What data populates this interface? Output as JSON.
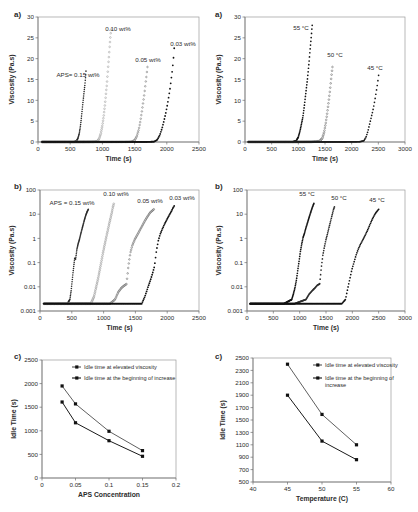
{
  "figure": {
    "panels": [
      "a-left",
      "a-right",
      "b-left",
      "b-right",
      "c-left",
      "c-right"
    ],
    "labels": {
      "a": "a)",
      "b": "b)",
      "c": "c)"
    }
  },
  "chart_data": [
    {
      "id": "a-left",
      "type": "scatter",
      "panel_label": "a)",
      "title": "",
      "xlabel": "Time (s)",
      "ylabel": "Viscosity (Pa.s)",
      "xlim": [
        0,
        2500
      ],
      "ylim": [
        0,
        30
      ],
      "xticks": [
        0,
        500,
        1000,
        1500,
        2000,
        2500
      ],
      "yticks": [
        0,
        5,
        10,
        15,
        20,
        25,
        30
      ],
      "yscale": "linear",
      "grid": false,
      "legend_position": "inline-annotations",
      "annotations": [
        "APS= 0.15 wt%",
        "0.10 wt%",
        "0.05 wt%",
        "0.03 wt%"
      ],
      "series": [
        {
          "name": "APS= 0.15 wt%",
          "onset_s": 590,
          "end_s": 745,
          "end_visc": 17.0,
          "x": [
            60,
            200,
            350,
            450,
            520,
            570,
            600,
            620,
            640,
            655,
            668,
            680,
            690,
            700,
            710,
            718,
            726,
            733,
            740,
            745
          ],
          "y": [
            0.02,
            0.02,
            0.02,
            0.03,
            0.04,
            0.08,
            0.3,
            0.9,
            2.0,
            3.4,
            5.0,
            6.8,
            8.3,
            9.8,
            11.2,
            12.4,
            13.4,
            14.6,
            15.8,
            17.0
          ]
        },
        {
          "name": "0.10 wt%",
          "onset_s": 930,
          "end_s": 1135,
          "end_visc": 27.0,
          "x": [
            60,
            300,
            550,
            750,
            870,
            920,
            950,
            975,
            1000,
            1020,
            1040,
            1055,
            1070,
            1082,
            1094,
            1104,
            1113,
            1121,
            1128,
            1135
          ],
          "y": [
            0.02,
            0.02,
            0.02,
            0.03,
            0.05,
            0.15,
            0.8,
            2.0,
            4.0,
            6.2,
            9.0,
            11.5,
            14.0,
            16.5,
            19.0,
            21.0,
            23.0,
            24.6,
            25.9,
            27.0
          ]
        },
        {
          "name": "0.05 wt%",
          "onset_s": 1480,
          "end_s": 1700,
          "end_visc": 18.0,
          "x": [
            60,
            400,
            800,
            1150,
            1350,
            1450,
            1500,
            1535,
            1565,
            1590,
            1612,
            1632,
            1650,
            1664,
            1676,
            1686,
            1692,
            1696,
            1699,
            1700
          ],
          "y": [
            0.02,
            0.02,
            0.02,
            0.02,
            0.03,
            0.06,
            0.4,
            1.4,
            3.0,
            5.0,
            7.2,
            9.4,
            11.4,
            13.2,
            14.8,
            16.0,
            16.9,
            17.4,
            17.8,
            18.0
          ]
        },
        {
          "name": "0.03 wt%",
          "onset_s": 1830,
          "end_s": 2115,
          "end_visc": 22.5,
          "x": [
            60,
            500,
            1000,
            1400,
            1700,
            1800,
            1850,
            1890,
            1925,
            1955,
            1985,
            2010,
            2032,
            2052,
            2068,
            2082,
            2094,
            2103,
            2110,
            2115
          ],
          "y": [
            0.02,
            0.02,
            0.02,
            0.02,
            0.03,
            0.08,
            0.5,
            1.6,
            3.2,
            5.0,
            7.0,
            9.0,
            11.0,
            13.0,
            15.0,
            16.8,
            18.5,
            20.0,
            21.4,
            22.5
          ]
        }
      ]
    },
    {
      "id": "a-right",
      "type": "scatter",
      "panel_label": "a)",
      "title": "",
      "xlabel": "Time (s)",
      "ylabel": "Viscosity (Pa.s)",
      "xlim": [
        0,
        3000
      ],
      "ylim": [
        0,
        30
      ],
      "xticks": [
        0,
        500,
        1000,
        1500,
        2000,
        2500,
        3000
      ],
      "yticks": [
        0,
        5,
        10,
        15,
        20,
        25,
        30
      ],
      "yscale": "linear",
      "grid": false,
      "legend_position": "inline-annotations",
      "annotations": [
        "55 °C",
        "50 °C",
        "45 °C"
      ],
      "series": [
        {
          "name": "55 °C",
          "onset_s": 960,
          "end_s": 1260,
          "end_visc": 28.0,
          "x": [
            60,
            400,
            700,
            900,
            960,
            1000,
            1030,
            1060,
            1085,
            1110,
            1130,
            1150,
            1170,
            1188,
            1204,
            1218,
            1232,
            1244,
            1253,
            1260
          ],
          "y": [
            0.02,
            0.02,
            0.02,
            0.05,
            0.3,
            1.2,
            2.6,
            4.4,
            6.0,
            8.4,
            10.6,
            12.8,
            15.0,
            17.4,
            19.6,
            21.8,
            23.8,
            25.5,
            27.0,
            28.0
          ]
        },
        {
          "name": "50 °C",
          "onset_s": 1430,
          "end_s": 1640,
          "end_visc": 18.0,
          "x": [
            60,
            500,
            900,
            1250,
            1400,
            1450,
            1485,
            1515,
            1542,
            1566,
            1588,
            1606,
            1620,
            1630,
            1636,
            1640
          ],
          "y": [
            0.02,
            0.02,
            0.02,
            0.04,
            0.2,
            0.9,
            2.4,
            4.6,
            7.0,
            9.4,
            11.8,
            14.0,
            15.8,
            16.9,
            17.6,
            18.0
          ]
        },
        {
          "name": "45 °C",
          "onset_s": 2230,
          "end_s": 2505,
          "end_visc": 16.0,
          "x": [
            60,
            700,
            1300,
            1900,
            2150,
            2230,
            2270,
            2305,
            2335,
            2365,
            2395,
            2420,
            2445,
            2465,
            2482,
            2495,
            2505
          ],
          "y": [
            0.02,
            0.02,
            0.02,
            0.03,
            0.06,
            0.3,
            1.2,
            2.6,
            4.2,
            5.8,
            7.4,
            9.0,
            10.8,
            12.4,
            13.8,
            15.0,
            16.0
          ]
        }
      ]
    },
    {
      "id": "b-left",
      "type": "scatter",
      "panel_label": "b)",
      "title": "",
      "xlabel": "Time (s)",
      "ylabel": "Viscosity (Pa.s)",
      "xlim": [
        0,
        2500
      ],
      "ylim": [
        0.001,
        100
      ],
      "xticks": [
        0,
        500,
        1000,
        1500,
        2000,
        2500
      ],
      "yticks": [
        0.001,
        0.01,
        0.1,
        1,
        10,
        100
      ],
      "yscale": "log",
      "grid": false,
      "legend_position": "inline-annotations",
      "annotations": [
        "APS = 0.15 wt%",
        "0.10 wt%",
        "0.05 wt%",
        "0.03 wt%"
      ],
      "series": [
        {
          "name": "APS = 0.15 wt%",
          "onset_s": 470,
          "end_s": 760,
          "end_visc": 16.0,
          "x": [
            60,
            200,
            350,
            430,
            470,
            490,
            520,
            545,
            560,
            580,
            600,
            620,
            640,
            660,
            680,
            700,
            720,
            740,
            760
          ],
          "y": [
            0.002,
            0.002,
            0.002,
            0.002,
            0.003,
            0.007,
            0.04,
            0.15,
            0.14,
            0.35,
            0.6,
            0.9,
            1.5,
            2.4,
            3.8,
            6.0,
            9.0,
            12.5,
            16.0
          ]
        },
        {
          "name": "0.10 wt%",
          "onset_s": 840,
          "end_s": 1160,
          "end_visc": 27.0,
          "x": [
            60,
            300,
            600,
            800,
            850,
            880,
            910,
            940,
            965,
            990,
            1010,
            1030,
            1050,
            1070,
            1090,
            1110,
            1130,
            1145,
            1160
          ],
          "y": [
            0.002,
            0.002,
            0.002,
            0.002,
            0.004,
            0.009,
            0.02,
            0.05,
            0.11,
            0.25,
            0.45,
            0.8,
            1.4,
            2.4,
            4.2,
            7.0,
            12.0,
            19.0,
            27.0
          ]
        },
        {
          "name": "0.05 wt%",
          "onset_s": 1180,
          "end_s": 1790,
          "end_visc": 16.0,
          "x": [
            60,
            400,
            800,
            1100,
            1180,
            1230,
            1280,
            1320,
            1360,
            1390,
            1420,
            1450,
            1490,
            1530,
            1570,
            1610,
            1650,
            1690,
            1730,
            1790
          ],
          "y": [
            0.002,
            0.002,
            0.002,
            0.002,
            0.003,
            0.006,
            0.009,
            0.011,
            0.013,
            0.07,
            0.25,
            0.5,
            0.9,
            1.4,
            2.2,
            3.4,
            5.4,
            8.0,
            11.5,
            16.0
          ]
        },
        {
          "name": "0.03 wt%",
          "onset_s": 1620,
          "end_s": 2110,
          "end_visc": 22.0,
          "x": [
            60,
            500,
            1000,
            1400,
            1600,
            1650,
            1700,
            1740,
            1775,
            1800,
            1830,
            1860,
            1890,
            1925,
            1960,
            1995,
            2030,
            2065,
            2090,
            2110
          ],
          "y": [
            0.002,
            0.002,
            0.002,
            0.002,
            0.002,
            0.004,
            0.01,
            0.02,
            0.04,
            0.07,
            0.3,
            0.8,
            1.5,
            2.5,
            4.0,
            6.0,
            9.0,
            13.0,
            18.0,
            22.0
          ]
        }
      ]
    },
    {
      "id": "b-right",
      "type": "scatter",
      "panel_label": "b)",
      "title": "",
      "xlabel": "Time (s)",
      "ylabel": "Viscosity (Pa.s)",
      "xlim": [
        0,
        3000
      ],
      "ylim": [
        0.001,
        100
      ],
      "xticks": [
        0,
        500,
        1000,
        1500,
        2000,
        2500,
        3000
      ],
      "yticks": [
        0.001,
        0.01,
        0.1,
        1,
        10,
        100
      ],
      "yscale": "log",
      "grid": false,
      "legend_position": "inline-annotations",
      "annotations": [
        "55 °C",
        "50 °C",
        "45 °C"
      ],
      "series": [
        {
          "name": "55 °C",
          "onset_s": 860,
          "end_s": 1270,
          "end_visc": 28.0,
          "x": [
            60,
            400,
            700,
            850,
            880,
            910,
            940,
            965,
            990,
            1015,
            1040,
            1065,
            1090,
            1120,
            1150,
            1180,
            1210,
            1240,
            1270
          ],
          "y": [
            0.002,
            0.002,
            0.002,
            0.003,
            0.005,
            0.009,
            0.02,
            0.05,
            0.12,
            0.3,
            0.6,
            1.1,
            1.6,
            2.8,
            4.5,
            7.5,
            12.0,
            19.0,
            28.0
          ]
        },
        {
          "name": "50 °C",
          "onset_s": 1150,
          "end_s": 1660,
          "end_visc": 20.0,
          "x": [
            60,
            500,
            900,
            1120,
            1180,
            1240,
            1290,
            1340,
            1380,
            1410,
            1440,
            1470,
            1500,
            1530,
            1560,
            1590,
            1620,
            1640,
            1660
          ],
          "y": [
            0.002,
            0.002,
            0.002,
            0.003,
            0.005,
            0.007,
            0.009,
            0.012,
            0.013,
            0.06,
            0.2,
            0.45,
            0.9,
            1.6,
            3.0,
            5.5,
            10.0,
            15.0,
            20.0
          ]
        },
        {
          "name": "45 °C",
          "onset_s": 1870,
          "end_s": 2500,
          "end_visc": 16.0,
          "x": [
            60,
            700,
            1300,
            1800,
            1870,
            1910,
            1950,
            1990,
            2030,
            2070,
            2110,
            2150,
            2190,
            2240,
            2290,
            2340,
            2390,
            2440,
            2500
          ],
          "y": [
            0.002,
            0.002,
            0.002,
            0.002,
            0.003,
            0.008,
            0.02,
            0.05,
            0.1,
            0.2,
            0.35,
            0.55,
            0.8,
            1.3,
            2.2,
            4.0,
            7.0,
            11.0,
            16.0
          ]
        }
      ]
    },
    {
      "id": "c-left",
      "type": "line",
      "panel_label": "c)",
      "title": "",
      "xlabel": "APS Concentration",
      "ylabel": "Idle Time (s)",
      "xlim": [
        0,
        0.2
      ],
      "ylim": [
        0,
        2500
      ],
      "xticks": [
        0,
        0.05,
        0.1,
        0.15,
        0.2
      ],
      "xticklabels": [
        "0",
        "0.05",
        "0.1",
        "0.15",
        "0.2"
      ],
      "yticks": [
        0,
        500,
        1000,
        1500,
        2000,
        2500
      ],
      "yscale": "linear",
      "grid": false,
      "legend_position": "top-center",
      "x": [
        0.03,
        0.05,
        0.1,
        0.15
      ],
      "series": [
        {
          "name": "Idle time at elevated viscosity",
          "values": [
            1950,
            1570,
            990,
            580
          ]
        },
        {
          "name": "Idle time at the beginning of increase",
          "values": [
            1610,
            1170,
            790,
            460
          ]
        }
      ]
    },
    {
      "id": "c-right",
      "type": "line",
      "panel_label": "c)",
      "title": "",
      "xlabel": "Temperature (C)",
      "ylabel": "Idle Time (s)",
      "xlim": [
        40,
        60
      ],
      "ylim": [
        500,
        2500
      ],
      "xticks": [
        40,
        45,
        50,
        55,
        60
      ],
      "yticks": [
        500,
        700,
        900,
        1100,
        1300,
        1500,
        1700,
        1900,
        2100,
        2300,
        2500
      ],
      "yscale": "linear",
      "grid": false,
      "legend_position": "top-right",
      "x": [
        45,
        50,
        55
      ],
      "series": [
        {
          "name": "Idle time at elevated viscosity",
          "values": [
            2400,
            1590,
            1100
          ]
        },
        {
          "name": "Idle time at the beginning of increase",
          "values": [
            1900,
            1160,
            860
          ]
        }
      ]
    }
  ]
}
